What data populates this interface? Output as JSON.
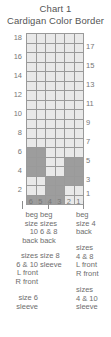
{
  "title": {
    "line1": "Chart 1",
    "line2": "Cardigan Color Border"
  },
  "chart_data": {
    "type": "heatmap",
    "title": "Chart 1 — Cardigan Color Border",
    "xlabel": "",
    "ylabel": "",
    "grid": true,
    "columns": 6,
    "rows": 18,
    "column_labels": [
      "6",
      "5",
      "4",
      "3",
      "2",
      "1"
    ],
    "row_labels_left": [
      "18",
      "16",
      "14",
      "12",
      "10",
      "8",
      "6",
      "4",
      "2"
    ],
    "row_labels_right": [
      "17",
      "15",
      "13",
      "11",
      "9",
      "7",
      "5",
      "3",
      "1"
    ],
    "colors": {
      "empty": "#e9e9e9",
      "filled": "#9d9d9d",
      "gridline": "#9a9a9a",
      "border": "#7d7d7d",
      "text": "#6e6e6e"
    },
    "legend_entries": [
      {
        "swatch": "empty",
        "label": "main color"
      },
      {
        "swatch": "filled",
        "label": "contrast color"
      }
    ],
    "cells": [
      {
        "row": 18,
        "values": [
          0,
          0,
          0,
          0,
          0,
          0
        ]
      },
      {
        "row": 17,
        "values": [
          0,
          0,
          0,
          0,
          0,
          0
        ]
      },
      {
        "row": 16,
        "values": [
          0,
          0,
          0,
          0,
          0,
          0
        ]
      },
      {
        "row": 15,
        "values": [
          0,
          0,
          0,
          0,
          0,
          0
        ]
      },
      {
        "row": 14,
        "values": [
          0,
          0,
          0,
          0,
          0,
          0
        ]
      },
      {
        "row": 13,
        "values": [
          0,
          0,
          0,
          0,
          0,
          0
        ]
      },
      {
        "row": 12,
        "values": [
          0,
          0,
          0,
          0,
          0,
          0
        ]
      },
      {
        "row": 11,
        "values": [
          0,
          0,
          0,
          0,
          0,
          0
        ]
      },
      {
        "row": 10,
        "values": [
          0,
          0,
          0,
          0,
          0,
          0
        ]
      },
      {
        "row": 9,
        "values": [
          0,
          0,
          0,
          0,
          0,
          0
        ]
      },
      {
        "row": 8,
        "values": [
          0,
          0,
          0,
          0,
          0,
          0
        ]
      },
      {
        "row": 7,
        "values": [
          0,
          0,
          0,
          0,
          0,
          0
        ]
      },
      {
        "row": 6,
        "values": [
          1,
          1,
          0,
          0,
          0,
          0
        ]
      },
      {
        "row": 5,
        "values": [
          1,
          1,
          0,
          0,
          1,
          1
        ]
      },
      {
        "row": 4,
        "values": [
          1,
          1,
          0,
          0,
          1,
          1
        ]
      },
      {
        "row": 3,
        "values": [
          0,
          0,
          1,
          1,
          1,
          1
        ]
      },
      {
        "row": 2,
        "values": [
          0,
          0,
          1,
          1,
          0,
          0
        ]
      },
      {
        "row": 1,
        "values": [
          1,
          1,
          1,
          1,
          0,
          0
        ]
      }
    ]
  },
  "legend": {
    "group_a": {
      "line1": "beg",
      "line2": "size",
      "line3": "10",
      "line4": "back"
    },
    "group_b": {
      "line1": "beg",
      "line2": "sizes",
      "line3": "6 & 8",
      "line4": "back"
    },
    "group_c": {
      "line1": "beg",
      "line2": "size 4",
      "line3": "back"
    },
    "group_d": {
      "line1": "sizes",
      "line2": "6 & 10",
      "line3": "L front",
      "line4": "R front"
    },
    "group_e": {
      "line1": "size 8",
      "line2": "sleeve"
    },
    "group_f": {
      "line1": "sizes",
      "line2": "4 & 8",
      "line3": "L front",
      "line4": "R front"
    },
    "group_g": {
      "line1": "size 6",
      "line2": "sleeve"
    },
    "group_h": {
      "line1": "sizes",
      "line2": "4 & 10",
      "line3": "sleeve"
    }
  }
}
